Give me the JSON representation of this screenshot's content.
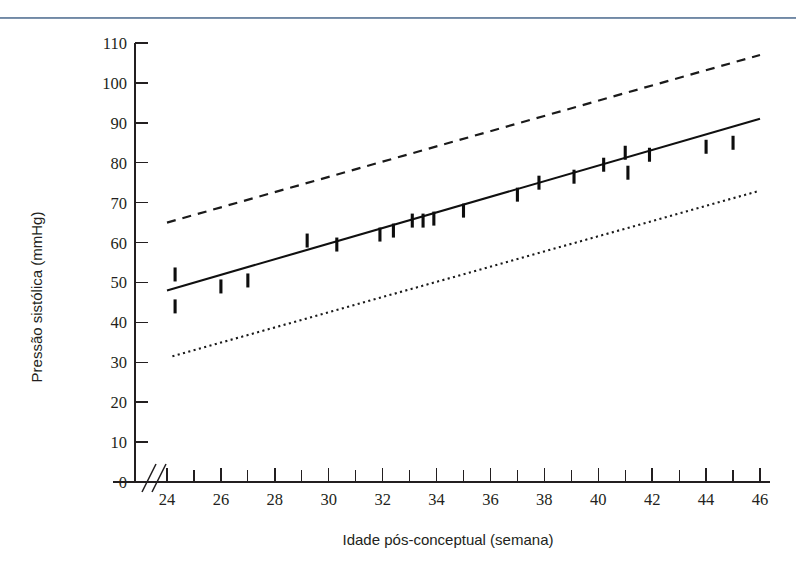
{
  "figure": {
    "name": "systolic-blood-pressure-vs-postconceptual-age",
    "top_rule_color": "#51698a",
    "background_color": "#ffffff",
    "ink_color": "#231f20"
  },
  "chart_data": {
    "type": "line",
    "title": "",
    "subtitle": "",
    "xlabel": "Idade pós-conceptual (semana)",
    "ylabel": "Pressão sistólica (mmHg)",
    "xlim": [
      24,
      46
    ],
    "ylim": [
      0,
      110
    ],
    "y_axis_break": true,
    "y_break_label": "0",
    "grid": false,
    "legend": "none",
    "xticks": [
      24,
      26,
      28,
      30,
      32,
      34,
      36,
      38,
      40,
      42,
      44,
      46
    ],
    "xticklabels": [
      "24",
      "26",
      "28",
      "30",
      "32",
      "34",
      "36",
      "38",
      "40",
      "42",
      "44",
      "46"
    ],
    "xticks_minor": [
      25,
      27,
      29,
      31,
      33,
      35,
      37,
      39,
      41,
      43,
      45
    ],
    "yticks": [
      0,
      10,
      20,
      30,
      40,
      50,
      60,
      70,
      80,
      90,
      100,
      110
    ],
    "yticklabels": [
      "0",
      "10",
      "20",
      "30",
      "40",
      "50",
      "60",
      "70",
      "80",
      "90",
      "100",
      "110"
    ],
    "series": [
      {
        "name": "Percentil 95 (tracejada)",
        "style": "dashed",
        "color": "#1a1a1a",
        "x": [
          24,
          46
        ],
        "values": [
          65,
          107
        ]
      },
      {
        "name": "Média / regressão (sólida)",
        "style": "solid",
        "color": "#101010",
        "x": [
          24,
          46
        ],
        "values": [
          48,
          91
        ]
      },
      {
        "name": "Percentil 5 (pontilhada)",
        "style": "dotted",
        "color": "#1a1a1a",
        "x": [
          24.2,
          46
        ],
        "values": [
          31.5,
          73
        ]
      },
      {
        "name": "Observações (marcas verticais)",
        "style": "markers",
        "color": "#0d0d0d",
        "points": [
          {
            "x": 24.3,
            "y": 52.0
          },
          {
            "x": 24.3,
            "y": 44.0
          },
          {
            "x": 26.0,
            "y": 49.0
          },
          {
            "x": 27.0,
            "y": 50.5
          },
          {
            "x": 29.2,
            "y": 60.5
          },
          {
            "x": 30.3,
            "y": 59.5
          },
          {
            "x": 31.9,
            "y": 62.0
          },
          {
            "x": 32.4,
            "y": 63.0
          },
          {
            "x": 33.1,
            "y": 65.5
          },
          {
            "x": 33.5,
            "y": 65.5
          },
          {
            "x": 33.9,
            "y": 66.0
          },
          {
            "x": 35.0,
            "y": 68.0
          },
          {
            "x": 37.0,
            "y": 72.0
          },
          {
            "x": 37.8,
            "y": 75.0
          },
          {
            "x": 39.1,
            "y": 76.5
          },
          {
            "x": 40.2,
            "y": 79.5
          },
          {
            "x": 41.0,
            "y": 82.5
          },
          {
            "x": 41.1,
            "y": 77.5
          },
          {
            "x": 41.9,
            "y": 82.0
          },
          {
            "x": 44.0,
            "y": 84.0
          },
          {
            "x": 45.0,
            "y": 85.0
          }
        ]
      }
    ]
  }
}
